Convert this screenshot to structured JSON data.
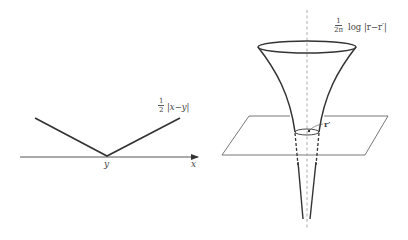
{
  "left_panel": {
    "function_label": {
      "coef_num": "1",
      "coef_den": "2",
      "expr": "|x−y|"
    },
    "axis_label": "x",
    "vertex_label": "y"
  },
  "right_panel": {
    "function_label": {
      "coef_num": "1",
      "coef_den": "2π",
      "expr": "log |r−r′|"
    },
    "point_label": "r′"
  },
  "colors": {
    "stroke": "#333333",
    "axis": "#555555",
    "dashed": "#888888",
    "background": "#ffffff"
  }
}
